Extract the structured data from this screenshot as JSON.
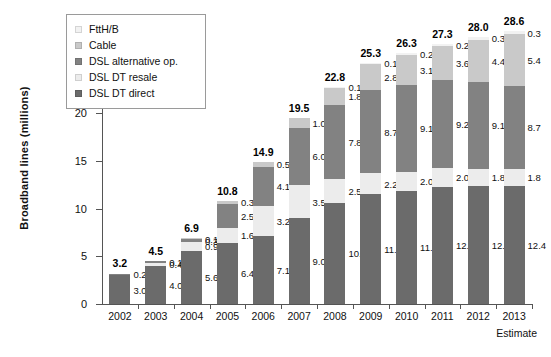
{
  "chart_data": {
    "type": "bar",
    "stacked": true,
    "title": "",
    "xlabel": "",
    "ylabel": "Broadband lines (millions)",
    "ylim": [
      0,
      30
    ],
    "ytick_labels": [
      "0",
      "5",
      "10",
      "15",
      "20",
      "25",
      "30"
    ],
    "ytick_values": [
      0,
      5,
      10,
      15,
      20,
      25,
      30
    ],
    "grid": false,
    "legend_position": "top-left-inset",
    "categories": [
      "2002",
      "2003",
      "2004",
      "2005",
      "2006",
      "2007",
      "2008",
      "2009",
      "2010",
      "2011",
      "2012",
      "2013"
    ],
    "series": [
      {
        "name": "DSL DT direct",
        "color": "#6b6b6b",
        "values": [
          3.0,
          4.0,
          5.6,
          6.4,
          7.1,
          9.0,
          10.6,
          11.5,
          11.9,
          12.3,
          12.4,
          12.4
        ],
        "labels": [
          "3.0",
          "4.0",
          "5.6",
          "6.4",
          "7.1",
          "9.0",
          "10.6",
          "11.5",
          "11.9",
          "12.3",
          "12.4",
          "12.4"
        ]
      },
      {
        "name": "DSL DT resale",
        "color": "#ececec",
        "values": [
          0,
          0.3,
          0.9,
          1.6,
          3.2,
          3.5,
          2.5,
          2.2,
          2.0,
          2.0,
          1.8,
          1.8
        ],
        "labels": [
          "",
          "0.4",
          "0.9",
          "1.6",
          "3.2",
          "3.5",
          "2.5",
          "2.2",
          "2.0",
          "2.0",
          "1.8",
          "1.8"
        ]
      },
      {
        "name": "DSL alternative op.",
        "color": "#828282",
        "values": [
          0.2,
          0.2,
          0.3,
          2.5,
          4.1,
          6.0,
          7.8,
          8.7,
          9.1,
          9.2,
          9.1,
          8.7
        ],
        "labels": [
          "0.2",
          "0.1",
          "0.3",
          "2.5",
          "4.1",
          "6.0",
          "7.8",
          "8.7",
          "9.1",
          "9.2",
          "9.1",
          "8.7"
        ]
      },
      {
        "name": "Cable",
        "color": "#c9c9c9",
        "values": [
          0,
          0,
          0.1,
          0.3,
          0.5,
          1.0,
          1.8,
          2.8,
          3.1,
          3.6,
          4.4,
          5.4
        ],
        "labels": [
          "",
          "",
          "0.1",
          "0.3",
          "0.5",
          "1.0",
          "1.8",
          "2.8",
          "3.1",
          "3.6",
          "4.4",
          "5.4"
        ]
      },
      {
        "name": "FttH/B",
        "color": "#f2f2f2",
        "values": [
          0,
          0,
          0,
          0,
          0,
          0,
          0.1,
          0.1,
          0.2,
          0.2,
          0.3,
          0.3
        ],
        "labels": [
          "",
          "",
          "",
          "",
          "",
          "",
          "0.1",
          "0.1",
          "0.2",
          "0.2",
          "0.3",
          "0.3"
        ]
      }
    ],
    "totals": [
      3.2,
      4.5,
      6.9,
      10.8,
      14.9,
      19.5,
      22.8,
      25.3,
      26.3,
      27.3,
      28.0,
      28.6
    ],
    "total_labels": [
      "3.2",
      "4.5",
      "6.9",
      "10.8",
      "14.9",
      "19.5",
      "22.8",
      "25.3",
      "26.3",
      "27.3",
      "28.0",
      "28.6"
    ],
    "annotations": [
      "Estimate"
    ]
  },
  "legend": {
    "items": [
      {
        "label": "FttH/B",
        "color": "#f2f2f2"
      },
      {
        "label": "Cable",
        "color": "#c9c9c9"
      },
      {
        "label": "DSL alternative op.",
        "color": "#828282"
      },
      {
        "label": "DSL DT resale",
        "color": "#ececec"
      },
      {
        "label": "DSL DT direct",
        "color": "#6b6b6b"
      }
    ]
  },
  "footnote": {
    "estimate": "Estimate"
  }
}
